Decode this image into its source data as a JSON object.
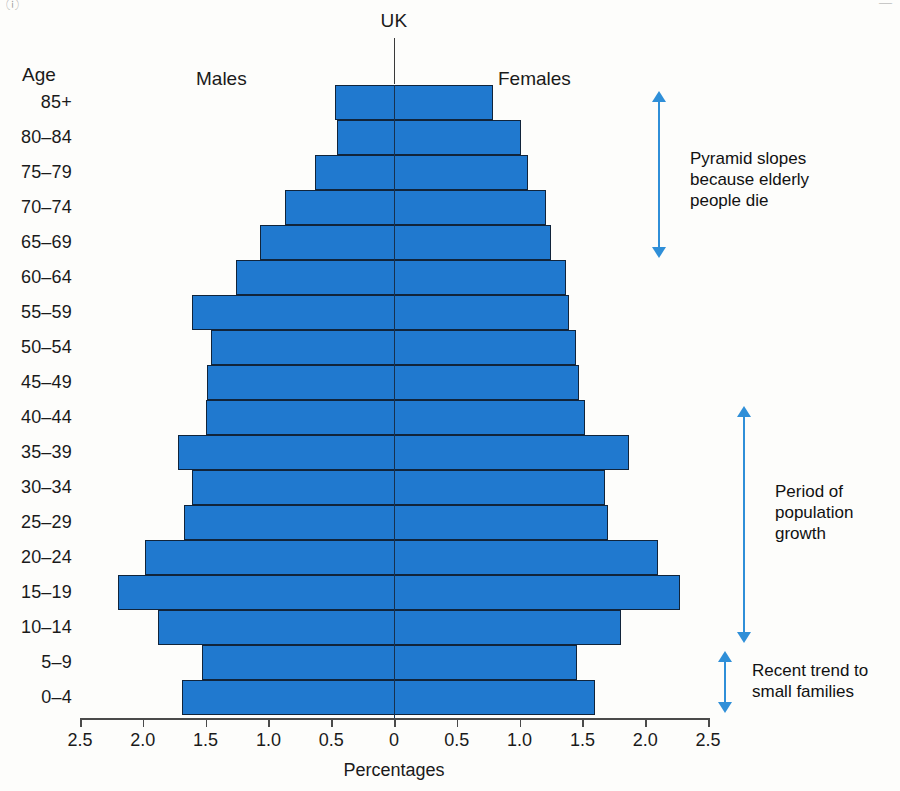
{
  "chart_data": {
    "type": "bar",
    "subtype": "population-pyramid",
    "title": "UK",
    "xlabel": "Percentages",
    "ylabel": "Age",
    "categories": [
      "85+",
      "80–84",
      "75–79",
      "70–74",
      "65–69",
      "60–64",
      "55–59",
      "50–54",
      "45–49",
      "40–44",
      "35–39",
      "30–34",
      "25–29",
      "20–24",
      "15–19",
      "10–14",
      "5–9",
      "0–4"
    ],
    "series": [
      {
        "name": "Males",
        "side": "left",
        "values": [
          0.47,
          0.45,
          0.63,
          0.87,
          1.07,
          1.26,
          1.61,
          1.46,
          1.49,
          1.5,
          1.72,
          1.61,
          1.67,
          1.98,
          2.2,
          1.88,
          1.53,
          1.69
        ]
      },
      {
        "name": "Females",
        "side": "right",
        "values": [
          0.79,
          1.01,
          1.07,
          1.21,
          1.25,
          1.37,
          1.39,
          1.45,
          1.47,
          1.52,
          1.87,
          1.68,
          1.7,
          2.1,
          2.28,
          1.81,
          1.46,
          1.6
        ]
      }
    ],
    "xticks": [
      "2.5",
      "2.0",
      "1.5",
      "1.0",
      "0.5",
      "0",
      "0.5",
      "1.0",
      "1.5",
      "2.0",
      "2.5"
    ],
    "xtick_values": [
      -2.5,
      -2.0,
      -1.5,
      -1.0,
      -0.5,
      0,
      0.5,
      1.0,
      1.5,
      2.0,
      2.5
    ],
    "xlim": [
      -2.5,
      2.5
    ],
    "grid": false,
    "legend": "none",
    "bar_color": "#2079cf",
    "bar_edge_color": "#11243a",
    "annotation_color": "#2f8fd8"
  },
  "header": {
    "chart_title": "UK",
    "age_axis_label": "Age",
    "males_label": "Males",
    "females_label": "Females"
  },
  "footer": {
    "x_axis_title": "Percentages"
  },
  "annotations": [
    {
      "id": "pyramid-slopes",
      "text": "Pyramid slopes\nbecause elderly\npeople die",
      "line1": "Pyramid slopes",
      "line2": "because elderly",
      "line3": "people die",
      "from_age": "85+",
      "to_age": "65–69"
    },
    {
      "id": "population-growth",
      "text": "Period of\npopulation\ngrowth",
      "line1": "Period of",
      "line2": "population",
      "line3": "growth",
      "from_age": "40–44",
      "to_age": "10–14"
    },
    {
      "id": "small-families",
      "text": "Recent trend to\nsmall families",
      "line1": "Recent trend to",
      "line2": "small families",
      "from_age": "5–9",
      "to_age": "0–4"
    }
  ],
  "scan_marks": {
    "left": "ⓘ",
    "right": "—"
  }
}
